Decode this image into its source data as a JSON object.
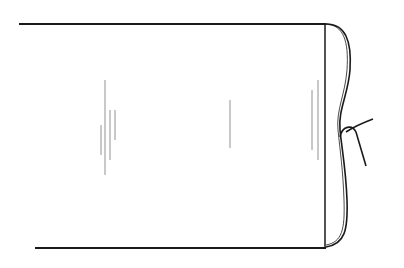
{
  "figure": {
    "label": "Ribbon",
    "colors": {
      "ink": "#1a1a1a",
      "hatch": "#555555",
      "background": "#ffffff"
    },
    "parts": [
      "ribbon-strip",
      "top-edge",
      "bottom-edge",
      "right-edge",
      "tie-string",
      "knot"
    ]
  }
}
